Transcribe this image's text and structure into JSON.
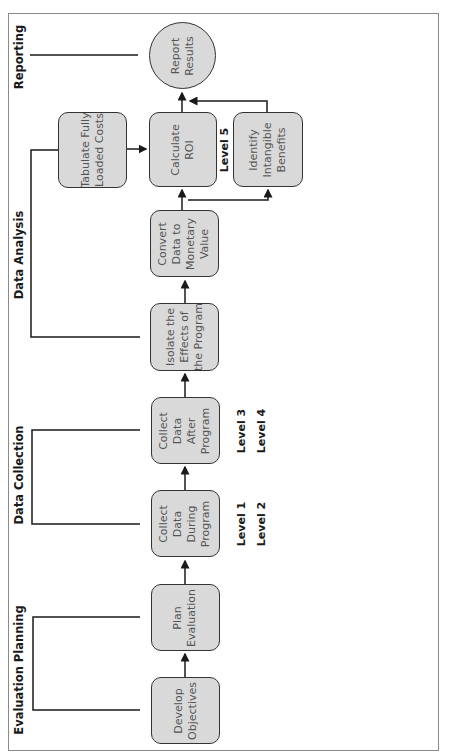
{
  "phases": {
    "evaluation_planning": "Evaluation Planning",
    "data_collection": "Data Collection",
    "data_analysis": "Data Analysis",
    "reporting": "Reporting"
  },
  "steps": {
    "develop_objectives": "Develop\nObjectives",
    "plan_evaluation": "Plan\nEvaluation",
    "collect_during": "Collect\nData\nDuring\nProgram",
    "collect_after": "Collect\nData\nAfter\nProgram",
    "isolate_effects": "Isolate the\nEffects of\nthe Program",
    "convert_data": "Convert\nData to\nMonetary\nValue",
    "calculate_roi": "Calculate\nROI",
    "identify_intangible": "Identify\nIntangible\nBenefits",
    "tabulate_costs": "Tabulate Fully\nLoaded Costs",
    "report_results": "Report\nResults"
  },
  "levels": {
    "during": "Level 1\nLevel 2",
    "after": "Level 3\nLevel 4",
    "roi": "Level 5"
  },
  "colors": {
    "box_fill": "#d9d9d9",
    "box_border": "#333333",
    "line": "#1a1a1a",
    "frame": "#8a8a8a"
  }
}
